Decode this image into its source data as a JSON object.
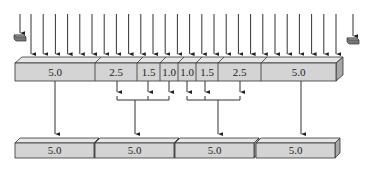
{
  "diagram": {
    "colors": {
      "block_face": "#d4d4d4",
      "block_top": "#e6e6e6",
      "block_side": "#a8a8a8",
      "stroke": "#333333",
      "arrow": "#333333"
    },
    "top_bar": {
      "segments": [
        {
          "label": "5.0"
        },
        {
          "label": "2.5"
        },
        {
          "label": "1.5"
        },
        {
          "label": "1.0"
        },
        {
          "label": "1.0"
        },
        {
          "label": "1.5"
        },
        {
          "label": "2.5"
        },
        {
          "label": "5.0"
        }
      ]
    },
    "bottom_blocks": [
      {
        "label": "5.0"
      },
      {
        "label": "5.0"
      },
      {
        "label": "5.0"
      },
      {
        "label": "5.0"
      }
    ],
    "input_arrow_count": 26,
    "end_markers": [
      "left-stopper",
      "right-stopper"
    ]
  }
}
